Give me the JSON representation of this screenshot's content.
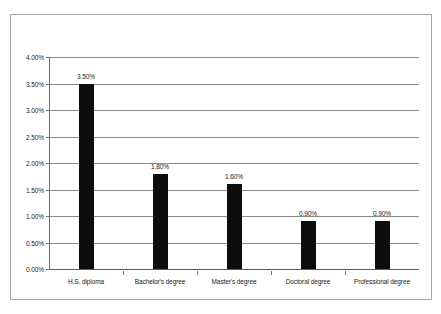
{
  "chart_data": {
    "type": "bar",
    "title": "",
    "xlabel": "",
    "ylabel": "",
    "categories": [
      "H.S. diploma",
      "Bachelor's degree",
      "Master's degree",
      "Doctoral degree",
      "Professional degree"
    ],
    "values": [
      3.5,
      1.8,
      1.6,
      0.9,
      0.9
    ],
    "data_labels": [
      "3.50%",
      "1.80%",
      "1.60%",
      "0.90%",
      "0.90%"
    ],
    "ylim": [
      0,
      4.0
    ],
    "ytick_values": [
      0.0,
      0.5,
      1.0,
      1.5,
      2.0,
      2.5,
      3.0,
      3.5,
      4.0
    ],
    "ytick_labels": [
      "0.00%",
      "0.50%",
      "1.00%",
      "1.50%",
      "2.00%",
      "2.50%",
      "3.00%",
      "3.50%",
      "4.00%"
    ],
    "grid": true,
    "legend": false,
    "bar_color": "#0d0d0d",
    "gridline_color": "#8a8a8a",
    "axis_color": "#6e6e6e",
    "border_color": "#a6a6a6",
    "background_color": "#ffffff"
  }
}
